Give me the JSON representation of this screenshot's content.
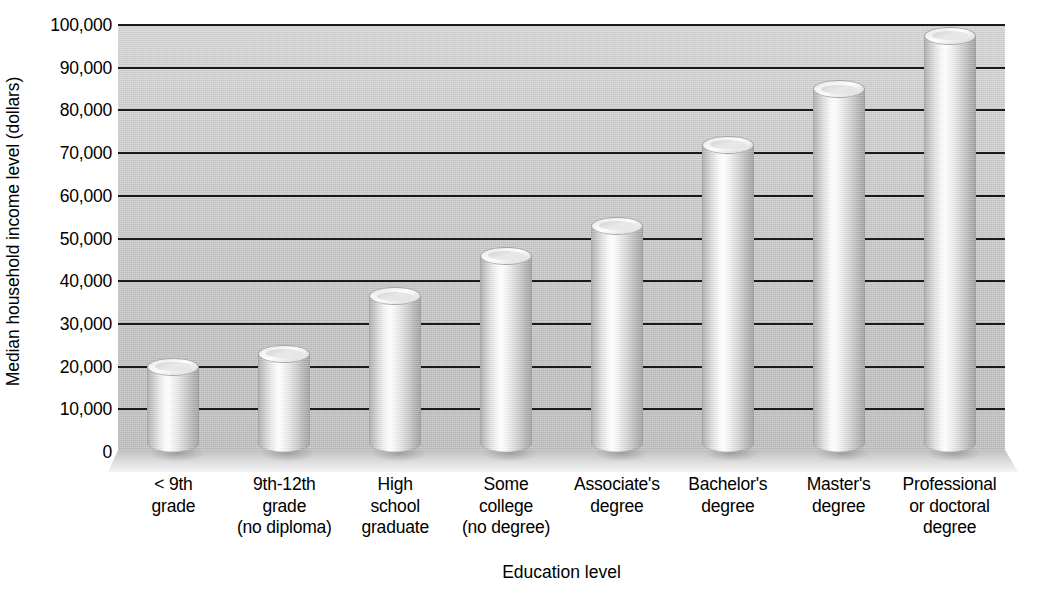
{
  "chart_data": {
    "type": "bar",
    "title": "",
    "xlabel": "Education level",
    "ylabel": "Median household income level (dollars)",
    "categories": [
      "< 9th\ngrade",
      "9th-12th\ngrade\n(no diploma)",
      "High\nschool\ngraduate",
      "Some\ncollege\n(no degree)",
      "Associate's\ndegree",
      "Bachelor's\ndegree",
      "Master's\ndegree",
      "Professional\nor doctoral\ndegree"
    ],
    "values": [
      20000,
      23000,
      36500,
      46000,
      53000,
      72000,
      85000,
      97500
    ],
    "ylim": [
      0,
      100000
    ],
    "ytick_step": 10000,
    "ytick_labels": [
      "100,000",
      "90,000",
      "80,000",
      "70,000",
      "60,000",
      "50,000",
      "40,000",
      "30,000",
      "20,000",
      "10,000",
      "0"
    ],
    "ytick_values": [
      100000,
      90000,
      80000,
      70000,
      60000,
      50000,
      40000,
      30000,
      20000,
      10000,
      0
    ],
    "grid": true,
    "grid_axis": "y",
    "legend": "none",
    "bar_style": "3d-cylinder",
    "colors": {
      "plot_background": "#c9c9c9",
      "gridline": "#1a1a1a",
      "bar_light": "#ffffff",
      "bar_dark": "#9d9d9d",
      "text": "#000000",
      "page_background": "#ffffff"
    }
  },
  "axis": {
    "y_title": "Median household income level (dollars)",
    "x_title": "Education level"
  },
  "x_labels": [
    {
      "lines": [
        "< 9th",
        "grade"
      ]
    },
    {
      "lines": [
        "9th-12th",
        "grade",
        "(no diploma)"
      ]
    },
    {
      "lines": [
        "High",
        "school",
        "graduate"
      ]
    },
    {
      "lines": [
        "Some",
        "college",
        "(no degree)"
      ]
    },
    {
      "lines": [
        "Associate's",
        "degree"
      ]
    },
    {
      "lines": [
        "Bachelor's",
        "degree"
      ]
    },
    {
      "lines": [
        "Master's",
        "degree"
      ]
    },
    {
      "lines": [
        "Professional",
        "or doctoral",
        "degree"
      ]
    }
  ]
}
